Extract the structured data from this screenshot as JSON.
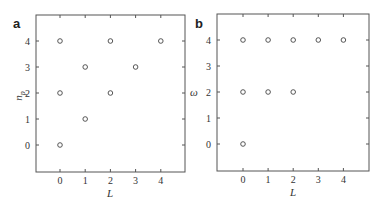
{
  "chart_data": [
    {
      "panel": "a",
      "type": "scatter",
      "title": "",
      "xlabel": "L",
      "ylabel": "n_p",
      "xlim": [
        -1,
        5
      ],
      "ylim": [
        -1,
        5
      ],
      "xticks": [
        0,
        1,
        2,
        3,
        4
      ],
      "yticks": [
        0,
        1,
        2,
        3,
        4
      ],
      "grid": false,
      "marker": "open-circle",
      "points": [
        {
          "x": 0,
          "y": 0
        },
        {
          "x": 0,
          "y": 2
        },
        {
          "x": 0,
          "y": 4
        },
        {
          "x": 1,
          "y": 1
        },
        {
          "x": 1,
          "y": 3
        },
        {
          "x": 2,
          "y": 2
        },
        {
          "x": 2,
          "y": 4
        },
        {
          "x": 3,
          "y": 3
        },
        {
          "x": 4,
          "y": 4
        }
      ]
    },
    {
      "panel": "b",
      "type": "scatter",
      "title": "",
      "xlabel": "L",
      "ylabel": "ω",
      "xlim": [
        -1,
        5
      ],
      "ylim": [
        -1,
        5
      ],
      "xticks": [
        0,
        1,
        2,
        3,
        4
      ],
      "yticks": [
        0,
        1,
        2,
        3,
        4
      ],
      "grid": false,
      "marker": "open-circle",
      "points": [
        {
          "x": 0,
          "y": 0
        },
        {
          "x": 0,
          "y": 2
        },
        {
          "x": 0,
          "y": 4
        },
        {
          "x": 1,
          "y": 2
        },
        {
          "x": 1,
          "y": 4
        },
        {
          "x": 2,
          "y": 2
        },
        {
          "x": 2,
          "y": 4
        },
        {
          "x": 3,
          "y": 4
        },
        {
          "x": 4,
          "y": 4
        }
      ]
    }
  ],
  "panels": {
    "a": {
      "label": "a",
      "xlabel": "L",
      "ylabel": "n",
      "ylabel_sub": "p",
      "xticks": [
        "0",
        "1",
        "2",
        "3",
        "4"
      ],
      "yticks": [
        "0",
        "1",
        "2",
        "3",
        "4"
      ]
    },
    "b": {
      "label": "b",
      "xlabel": "L",
      "ylabel": "ω",
      "xticks": [
        "0",
        "1",
        "2",
        "3",
        "4"
      ],
      "yticks": [
        "0",
        "1",
        "2",
        "3",
        "4"
      ]
    }
  }
}
